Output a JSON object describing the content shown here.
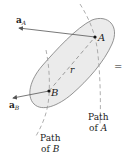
{
  "diagram": {
    "points": {
      "A": {
        "label": "A",
        "x": 95,
        "y": 37
      },
      "B": {
        "label": "B",
        "x": 49,
        "y": 91
      }
    },
    "vectors": {
      "aA": {
        "label_main": "a",
        "label_sub": "A"
      },
      "aB": {
        "label_main": "a",
        "label_sub": "B"
      }
    },
    "position_label": "r",
    "paths": {
      "A": {
        "line1": "Path",
        "line2_prefix": "of ",
        "line2_var": "A"
      },
      "B": {
        "line1": "Path",
        "line2_prefix": "of ",
        "line2_var": "B"
      }
    },
    "equals_sign": "=",
    "colors": {
      "body_fill": "#ebebeb",
      "body_stroke": "#7a7a7a",
      "arrow": "#555555",
      "dashed": "#999999",
      "text": "#222222"
    }
  }
}
